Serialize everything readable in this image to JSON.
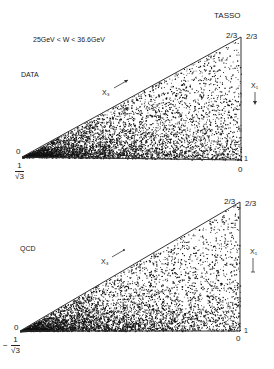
{
  "figure": {
    "panels": [
      {
        "name": "data",
        "label": "DATA",
        "experiment": "TASSO",
        "energy_range": "25GeV < W < 36.6GeV",
        "apex_left_label": "2/3",
        "apex_right_label": "2/3",
        "left_vertex_label": "0",
        "bottom_left_num": "1",
        "bottom_left_den": "√3",
        "bottom_right_upper": "1",
        "bottom_right_lower": "0",
        "x3_axis": "X₃",
        "x1_axis": "X₁"
      },
      {
        "name": "qcd",
        "label": "QCD",
        "apex_left_label": "2/3",
        "apex_right_label": "2/3",
        "left_vertex_label": "0",
        "bottom_left_prefix": "−",
        "bottom_left_num": "1",
        "bottom_left_den": "√3",
        "bottom_right_upper": "1",
        "bottom_right_lower": "0",
        "x3_axis": "X₃",
        "x1_axis": "X₁"
      }
    ]
  },
  "chart_data": [
    {
      "type": "scatter",
      "title": "DATA",
      "annotation": "TASSO, 25GeV < W < 36.6GeV",
      "xlabel": "X₃",
      "ylabel": "X₁",
      "description": "Dalitz-style triangle of event density; dense near the bottom edge (X₁ → 1) and the left vertex, sparse toward the 2/3 apex",
      "vertices": {
        "left": "0 / 1/√3",
        "top_right": "2/3",
        "bottom_right": "1 / 0"
      }
    },
    {
      "type": "scatter",
      "title": "QCD",
      "xlabel": "X₃",
      "ylabel": "X₁",
      "description": "QCD prediction; same triangular domain, density concentrated along the bottom edge and left vertex",
      "vertices": {
        "left": "0 / −1/√3",
        "top_right": "2/3",
        "bottom_right": "1 / 0"
      }
    }
  ]
}
